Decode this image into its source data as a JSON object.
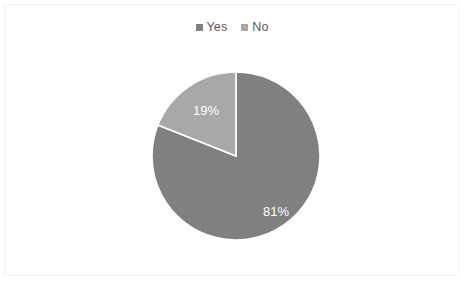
{
  "chart_data": {
    "type": "pie",
    "title": "",
    "subtitle": "",
    "xlabel": "",
    "ylabel": "",
    "grid": false,
    "legend_position": "top",
    "start_angle_deg": 0,
    "direction": "clockwise",
    "categories": [
      "Yes",
      "No"
    ],
    "values": [
      81,
      19
    ],
    "value_unit": "%",
    "slices": [
      {
        "label": "Yes",
        "value": 81,
        "data_label": "81%",
        "color": "#808080",
        "angle_deg": 291.6
      },
      {
        "label": "No",
        "value": 19,
        "data_label": "19%",
        "color": "#a8a8a8",
        "angle_deg": 68.4
      }
    ],
    "annotations": [],
    "label_color": "#ffffff",
    "divider_color": "#ffffff"
  },
  "legend": {
    "items": [
      {
        "label": "Yes",
        "marker": "square-marker",
        "color": "#808080"
      },
      {
        "label": "No",
        "marker": "square-marker",
        "color": "#a8a8a8"
      }
    ]
  },
  "pie": {
    "center_x": 84,
    "center_y": 84,
    "radius": 84,
    "labels": [
      {
        "text": "81%",
        "x": 124,
        "y": 141
      },
      {
        "text": "19%",
        "x": 54,
        "y": 40
      }
    ]
  },
  "frame": {
    "border_color": "#f2f2f2",
    "background": "#ffffff"
  }
}
